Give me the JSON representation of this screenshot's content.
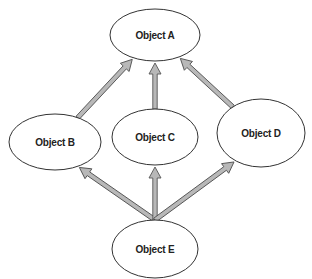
{
  "header": {
    "clipped_text": "",
    "note": "top line of text is cropped; only descenders visible"
  },
  "diagram": {
    "type": "inheritance-graph",
    "colors": {
      "stroke": "#333333",
      "arrow_fill": "#b8b8b8",
      "arrow_stroke": "#555555",
      "node_fill": "#ffffff"
    },
    "nodes": [
      {
        "id": "A",
        "label": "Object A",
        "cx": 155,
        "cy": 35,
        "rx": 45,
        "ry": 26
      },
      {
        "id": "B",
        "label": "Object B",
        "cx": 55,
        "cy": 142,
        "rx": 46,
        "ry": 28
      },
      {
        "id": "C",
        "label": "Object C",
        "cx": 155,
        "cy": 137,
        "rx": 43,
        "ry": 28
      },
      {
        "id": "D",
        "label": "Object D",
        "cx": 261,
        "cy": 133,
        "rx": 44,
        "ry": 34
      },
      {
        "id": "E",
        "label": "Object E",
        "cx": 155,
        "cy": 249,
        "rx": 43,
        "ry": 29
      }
    ],
    "edges": [
      {
        "from": "B",
        "to": "A"
      },
      {
        "from": "C",
        "to": "A"
      },
      {
        "from": "D",
        "to": "A"
      },
      {
        "from": "E",
        "to": "B"
      },
      {
        "from": "E",
        "to": "C"
      },
      {
        "from": "E",
        "to": "D"
      }
    ]
  }
}
